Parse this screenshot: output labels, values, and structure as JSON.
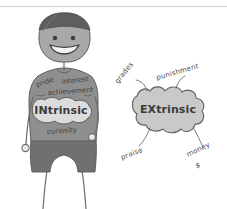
{
  "canvas": {
    "width": 227,
    "height": 209,
    "background": "#ffffff",
    "top_rule_color": "#cfcfcf"
  },
  "palette": {
    "ink": "#6b6b6b",
    "hair": "#5e5e5e",
    "skin": "#a8a8a8",
    "shirt": "#8f8f8f",
    "shorts": "#707070",
    "blob_fill": "#c9c9c9",
    "intrinsic_blob_fill": "#dcdcdc",
    "text": "#3f3f3f"
  },
  "figure": {
    "name": "cartoon-person",
    "face": {
      "expression": "smiling",
      "eye_count": 2
    }
  },
  "intrinsic": {
    "blob_label": "INtrinsic",
    "motivators": [
      {
        "label": "pride",
        "rotate": -18
      },
      {
        "label": "interest",
        "rotate": -6
      },
      {
        "label": "achievement",
        "rotate": -4
      },
      {
        "label": "curiosity",
        "rotate": -4
      }
    ]
  },
  "extrinsic": {
    "blob_label": "EXtrinsic",
    "motivators": [
      {
        "label": "grades",
        "rotate": -52
      },
      {
        "label": "punishment",
        "rotate": -16
      },
      {
        "label": "praise",
        "rotate": -22
      },
      {
        "label": "money",
        "rotate": -26
      },
      {
        "label": "$",
        "rotate": -10
      }
    ]
  }
}
